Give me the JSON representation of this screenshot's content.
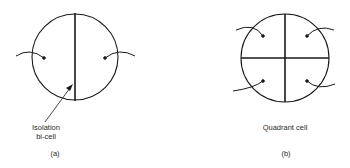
{
  "figure": {
    "panels": [
      {
        "id": "a",
        "caption": "(a)",
        "title": "Isolation bi-cell",
        "annotation_line1": "Isolation",
        "annotation_line2": "bi-cell",
        "segments": 2,
        "divider": "vertical"
      },
      {
        "id": "b",
        "caption": "(b)",
        "title": "Quadrant cell",
        "segments": 4,
        "divider": "cross"
      }
    ],
    "colors": {
      "stroke": "#1a1a1a",
      "background": "#ffffff",
      "text": "#2a2a2a"
    }
  }
}
